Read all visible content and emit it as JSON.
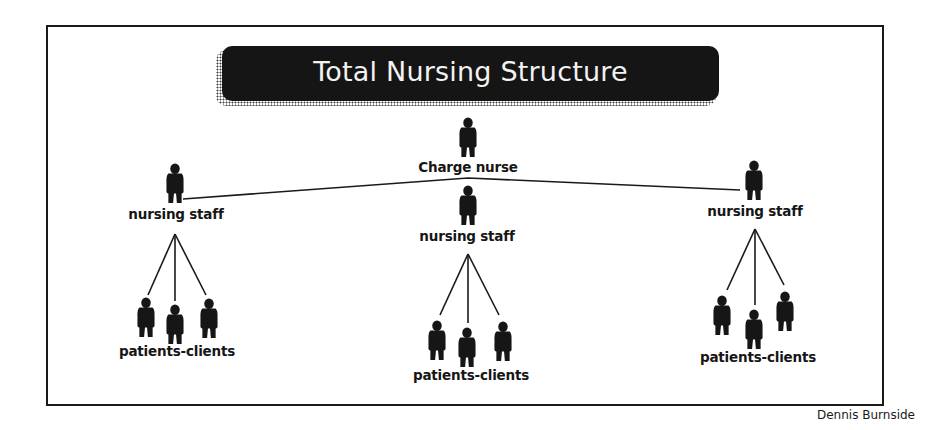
{
  "title": "Total Nursing Structure",
  "credit": "Dennis Burnside",
  "colors": {
    "ink": "#161616",
    "banner_bg": "#151515",
    "banner_text": "#f2f2f2",
    "background": "#ffffff"
  },
  "nodes": {
    "charge_nurse": {
      "label": "Charge nurse",
      "icon": "person-icon"
    },
    "staff_left": {
      "label": "nursing staff",
      "icon": "person-icon"
    },
    "staff_center": {
      "label": "nursing staff",
      "icon": "person-icon"
    },
    "staff_right": {
      "label": "nursing staff",
      "icon": "person-icon"
    },
    "patients_left": {
      "label": "patients-clients",
      "count": 3,
      "icon": "person-icon"
    },
    "patients_center": {
      "label": "patients-clients",
      "count": 3,
      "icon": "person-icon"
    },
    "patients_right": {
      "label": "patients-clients",
      "count": 3,
      "icon": "person-icon"
    }
  },
  "edges": [
    [
      "charge_nurse",
      "staff_left"
    ],
    [
      "charge_nurse",
      "staff_center"
    ],
    [
      "charge_nurse",
      "staff_right"
    ],
    [
      "staff_left",
      "patients_left"
    ],
    [
      "staff_center",
      "patients_center"
    ],
    [
      "staff_right",
      "patients_right"
    ]
  ]
}
